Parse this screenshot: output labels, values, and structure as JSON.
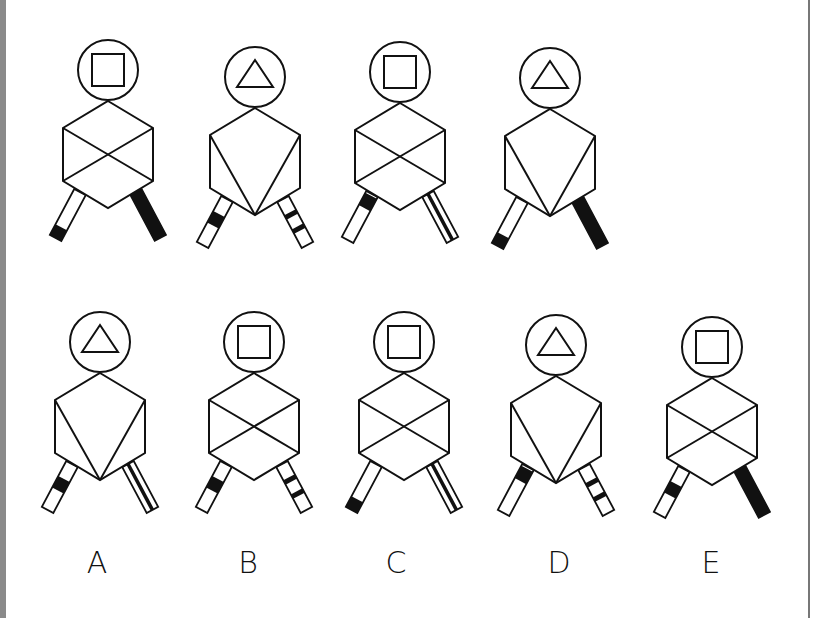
{
  "puzzle": {
    "stroke_color": "#111111",
    "fill_black": "#111111",
    "background": "#ffffff",
    "sequence": [
      {
        "id": "1",
        "cx": 108,
        "cy": 70,
        "head": "square",
        "body": "x",
        "left_leg": "end-black",
        "right_leg": "solid-black"
      },
      {
        "id": "2",
        "cx": 255,
        "cy": 77,
        "head": "triangle",
        "body": "v",
        "left_leg": "middle-band",
        "right_leg": "two-stripes"
      },
      {
        "id": "3",
        "cx": 400,
        "cy": 72,
        "head": "square",
        "body": "x",
        "left_leg": "top-black",
        "right_leg": "double-line"
      },
      {
        "id": "4",
        "cx": 550,
        "cy": 78,
        "head": "triangle",
        "body": "v",
        "left_leg": "end-black",
        "right_leg": "solid-black"
      }
    ],
    "options": [
      {
        "id": "A",
        "label": "A",
        "cx": 100,
        "cy": 342,
        "head": "triangle",
        "body": "v",
        "left_leg": "middle-band",
        "right_leg": "double-line"
      },
      {
        "id": "B",
        "label": "B",
        "cx": 254,
        "cy": 342,
        "head": "square",
        "body": "x",
        "left_leg": "middle-band",
        "right_leg": "two-stripes"
      },
      {
        "id": "C",
        "label": "C",
        "cx": 404,
        "cy": 342,
        "head": "square",
        "body": "x",
        "left_leg": "end-black",
        "right_leg": "double-line"
      },
      {
        "id": "D",
        "label": "D",
        "cx": 556,
        "cy": 345,
        "head": "triangle",
        "body": "v",
        "left_leg": "top-black",
        "right_leg": "two-stripes"
      },
      {
        "id": "E",
        "label": "E",
        "cx": 712,
        "cy": 347,
        "head": "square",
        "body": "x",
        "left_leg": "middle-band",
        "right_leg": "solid-black"
      }
    ]
  }
}
